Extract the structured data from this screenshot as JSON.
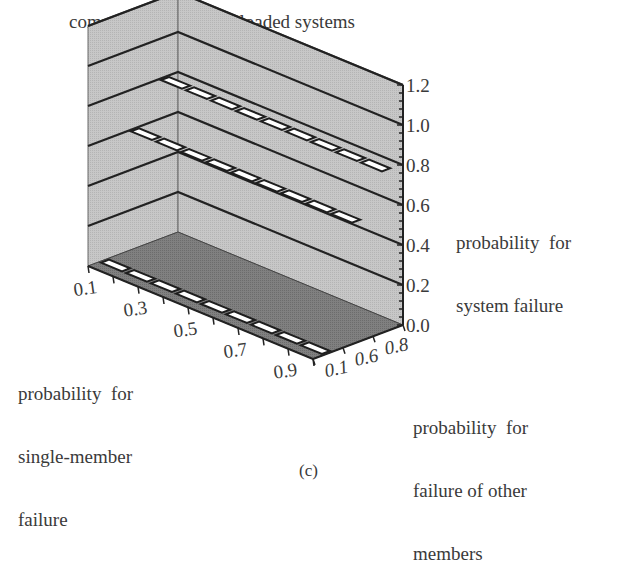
{
  "figure": {
    "title": "comparison of axially loaded systems",
    "caption": "(c)",
    "z_axis_label_lines": [
      "probability  for",
      "system failure"
    ],
    "x_axis_label_lines": [
      "probability  for",
      "single-member",
      "failure"
    ],
    "y_axis_label_lines": [
      "probability  for",
      "failure of other",
      "members"
    ]
  },
  "colors": {
    "walls": "#c4c4c4",
    "floor": "#7d7d7d",
    "gridline": "#222222",
    "series_fill": "#ffffff",
    "series_stroke": "#1e1e1e",
    "text": "#3a3a3a"
  },
  "chart_data": {
    "type": "3d-bar",
    "title": "comparison of axially loaded systems",
    "xlabel": "probability for single-member failure",
    "ylabel": "probability for failure of other members",
    "zlabel": "probability for system failure",
    "x_tick_labels": [
      "0.1",
      "0.3",
      "0.5",
      "0.7",
      "0.9"
    ],
    "x_categories": [
      0.1,
      0.2,
      0.3,
      0.4,
      0.5,
      0.6,
      0.7,
      0.8,
      0.9
    ],
    "y_tick_labels": [
      "0.1",
      "0.6",
      "0.8"
    ],
    "z_tick_labels": [
      "0.0",
      "0.2",
      "0.4",
      "0.6",
      "0.8",
      "1.0",
      "1.2"
    ],
    "zlim": [
      0,
      1.2
    ],
    "grid": true,
    "series": [
      {
        "name": "0.1",
        "values": [
          0.0,
          0.0,
          0.0,
          0.0,
          0.0,
          0.0,
          0.0,
          0.0,
          0.0
        ]
      },
      {
        "name": "0.6",
        "values": [
          0.6,
          0.6,
          0.6,
          0.6,
          0.6,
          0.6,
          0.6,
          0.6,
          0.6
        ]
      },
      {
        "name": "0.8",
        "values": [
          0.8,
          0.8,
          0.8,
          0.8,
          0.8,
          0.8,
          0.8,
          0.8,
          0.8
        ]
      }
    ]
  }
}
